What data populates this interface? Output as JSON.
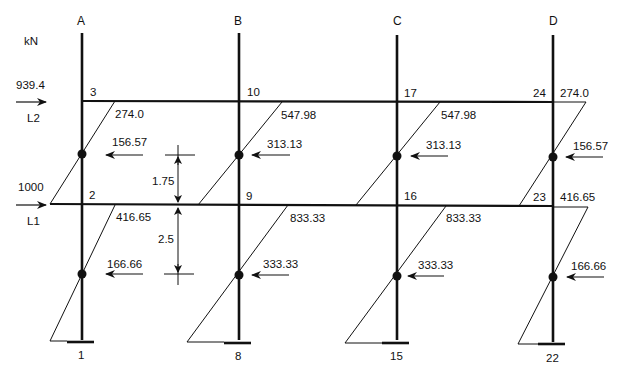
{
  "units": "kN",
  "columns": [
    {
      "label": "A",
      "x": 82
    },
    {
      "label": "B",
      "x": 239
    },
    {
      "label": "C",
      "x": 397
    },
    {
      "label": "D",
      "x": 553
    }
  ],
  "loads": [
    {
      "name": "L2",
      "value": "939.4"
    },
    {
      "name": "L1",
      "value": "1000"
    }
  ],
  "nodes": {
    "upper": [
      "3",
      "10",
      "17",
      "24"
    ],
    "lower": [
      "2",
      "9",
      "16",
      "23"
    ],
    "base": [
      "1",
      "8",
      "15",
      "22"
    ]
  },
  "upper_storey": {
    "moments": [
      "274.0",
      "547.98",
      "547.98",
      "274.0"
    ],
    "shears": [
      "156.57",
      "313.13",
      "313.13",
      "156.57"
    ]
  },
  "lower_storey": {
    "moments": [
      "416.65",
      "833.33",
      "833.33",
      "416.65"
    ],
    "shears": [
      "166.66",
      "333.33",
      "333.33",
      "166.66"
    ]
  },
  "dimensions": {
    "upper_to_floor": "1.75",
    "floor_to_lower": "2.5"
  }
}
